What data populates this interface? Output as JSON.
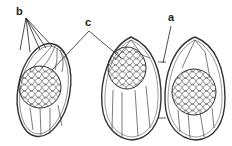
{
  "labels": {
    "a": "a",
    "b": "b",
    "c": "c"
  },
  "colors": {
    "stroke": "#333333",
    "background": "#ffffff"
  }
}
